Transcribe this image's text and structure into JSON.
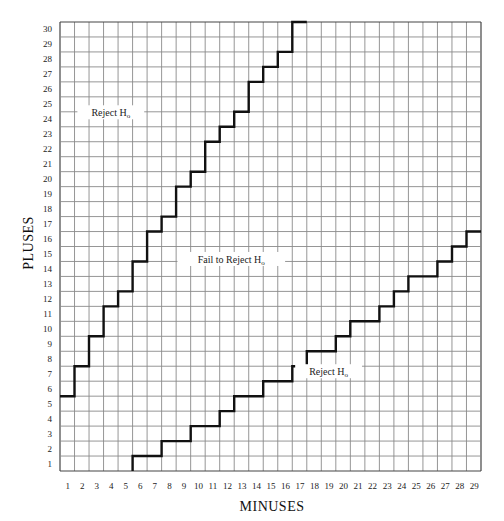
{
  "chart_data": {
    "type": "line",
    "title": "",
    "xlabel": "MINUSES",
    "ylabel": "PLUSES",
    "x_ticks": [
      1,
      2,
      3,
      4,
      5,
      6,
      7,
      8,
      9,
      10,
      11,
      12,
      13,
      14,
      15,
      16,
      17,
      18,
      19,
      20,
      21,
      22,
      23,
      24,
      25,
      26,
      27,
      28,
      29
    ],
    "y_ticks": [
      1,
      2,
      3,
      4,
      5,
      6,
      7,
      8,
      9,
      10,
      11,
      12,
      13,
      14,
      15,
      16,
      17,
      18,
      19,
      20,
      21,
      22,
      23,
      24,
      25,
      26,
      27,
      28,
      29,
      30
    ],
    "xlim": [
      1,
      29
    ],
    "ylim": [
      1,
      30
    ],
    "grid": true,
    "series": [
      {
        "name": "Upper critical boundary",
        "style": "step",
        "columns": [
          1,
          2,
          3,
          4,
          5,
          6,
          7,
          8,
          9,
          10,
          11,
          12,
          13,
          14,
          15,
          16,
          17
        ],
        "level_below_boundary_row": [
          5,
          7,
          9,
          11,
          12,
          14,
          16,
          17,
          19,
          20,
          22,
          23,
          24,
          26,
          27,
          28,
          30
        ],
        "start_from_left_edge": true
      },
      {
        "name": "Lower critical boundary",
        "style": "step",
        "columns": [
          6,
          7,
          8,
          9,
          10,
          11,
          12,
          13,
          14,
          15,
          16,
          17,
          18,
          19,
          20,
          21,
          22,
          23,
          24,
          25,
          26,
          27,
          28,
          29
        ],
        "level_below_boundary_row": [
          1,
          1,
          2,
          2,
          3,
          3,
          4,
          5,
          5,
          6,
          6,
          7,
          8,
          8,
          9,
          10,
          10,
          11,
          12,
          13,
          13,
          14,
          15,
          16
        ],
        "start_from_bottom_edge": true
      }
    ],
    "annotations": [
      {
        "text": "Reject H",
        "subscript": "o",
        "region": "upper-left",
        "col": 3.5,
        "row": 23.9
      },
      {
        "text": "Fail to Reject H",
        "subscript": "o",
        "region": "middle",
        "col": 11.8,
        "row": 14.1
      },
      {
        "text": "Reject H",
        "subscript": "o",
        "region": "lower-right",
        "col": 18.5,
        "row": 6.6
      }
    ]
  },
  "labels": {
    "x_axis_title": "MINUSES",
    "y_axis_title": "PLUSES",
    "region_upper": "Reject H",
    "region_middle": "Fail to Reject H",
    "region_lower": "Reject H",
    "subscript": "o"
  }
}
